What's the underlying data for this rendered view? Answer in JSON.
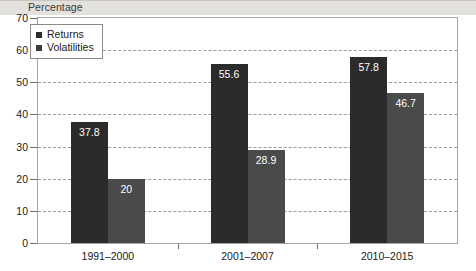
{
  "chart_data": {
    "type": "bar",
    "title": "",
    "subtitle": "",
    "ylabel": "Percentage",
    "xlabel": "",
    "ylim": [
      0,
      70
    ],
    "yticks": [
      0,
      10,
      20,
      30,
      40,
      50,
      60,
      70
    ],
    "ytick_labels": [
      "0",
      "10",
      "20",
      "30",
      "40",
      "50",
      "60",
      "70"
    ],
    "grid": "horizontal-dashed",
    "legend_position": "top-left",
    "categories": [
      "1991–2000",
      "2001–2007",
      "2010–2015"
    ],
    "series": [
      {
        "name": "Returns",
        "color": "#2b2b2b",
        "values": [
          37.8,
          55.6,
          57.8
        ],
        "labels": [
          "37.8",
          "55.6",
          "57.8"
        ]
      },
      {
        "name": "Volatilities",
        "color": "#4a4a4a",
        "values": [
          20,
          28.9,
          46.7
        ],
        "labels": [
          "20",
          "28.9",
          "46.7"
        ]
      }
    ]
  },
  "legend": {
    "items": [
      {
        "label": "Returns",
        "swatch": "#2b2b2b"
      },
      {
        "label": "Volatilities",
        "swatch": "#3d3d3d"
      }
    ]
  },
  "colors": {
    "returns": "#2b2b2b",
    "volatilities": "#4a4a4a",
    "header_band": "#e3e1dd",
    "frame": "#a8a5a0",
    "gridline": "#9b9b9b",
    "value_label": "#ffffff"
  }
}
